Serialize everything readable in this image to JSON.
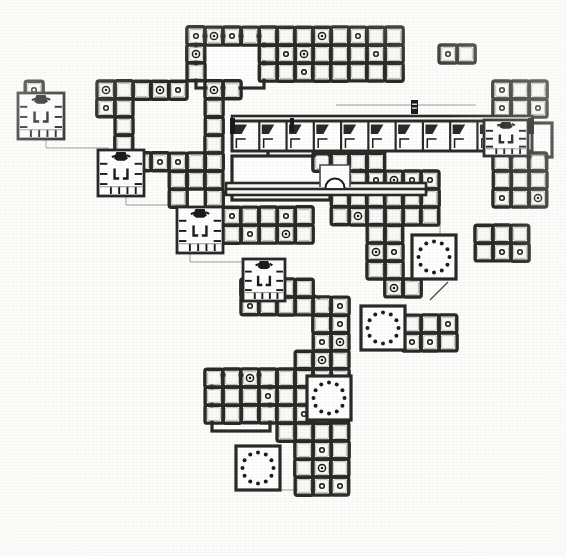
{
  "figure": {
    "title": "Archaeological ground plan of a multi-courtyard building complex",
    "type": "architectural-floor-plan",
    "medium": "scanned line drawing, black ink on off-white paper",
    "canvas": {
      "width": 566,
      "height": 556
    },
    "orientation": "plan view, north up (unmarked)",
    "caption": "",
    "scale_bar": "",
    "north_arrow": "",
    "labels": []
  },
  "colors": {
    "paper": "#fdfdfc",
    "ink": "#1a1a1a",
    "ink_mid": "#4a4a48",
    "ink_light": "#8d8d88",
    "wall_fill": "#2b2a28",
    "bay_interior": "#fbfaf8",
    "hatch": "#6f6e6a"
  },
  "geometry": {
    "module_px": 18.0,
    "origin_x": 16.0,
    "origin_y": 18.0,
    "wall_thickness_px": 3.4,
    "inner_inset_px": 2.6,
    "bay_corner_radius_px": 2.2,
    "column_dot_radius_px": 2.3,
    "column_ring_radius_px": 3.6
  },
  "legend_symbols": [
    {
      "name": "square-bay",
      "meaning": "roofed square bay / chamber unit",
      "count_note": "grid module"
    },
    {
      "name": "column-marker",
      "meaning": "small ring = standing column or pillar base inside bay"
    },
    {
      "name": "circular-colonnade",
      "meaning": "ring of dots = circular arrangement of columns in open court"
    },
    {
      "name": "shrine-module",
      "meaning": "detailed cell block with interior partitions and solid black feature"
    },
    {
      "name": "apse-niche",
      "meaning": "semicircular recess on corridor wall"
    },
    {
      "name": "pier-marker",
      "meaning": "small solid black pier symbol with light banding"
    },
    {
      "name": "thin-line",
      "meaning": "faint construction / projection line"
    }
  ],
  "plan": {
    "bay_blocks": [
      {
        "id": "b01",
        "col": 5,
        "row": 0,
        "cols": 9,
        "rows": 1,
        "note": "north range top row"
      },
      {
        "id": "b02",
        "col": 5,
        "row": 1,
        "cols": 9,
        "rows": 1,
        "note": "north range second row"
      },
      {
        "id": "b03",
        "col": 5,
        "row": 2,
        "cols": 4,
        "rows": 1,
        "note": "north range west arm"
      },
      {
        "id": "b04",
        "col": 9,
        "row": 2,
        "cols": 5,
        "rows": 1,
        "note": "north range east arm"
      },
      {
        "id": "b05",
        "col": 5,
        "row": 3,
        "cols": 1,
        "rows": 1,
        "note": "west pier of north court"
      },
      {
        "id": "b06",
        "col": 9,
        "row": 3,
        "cols": 2,
        "rows": 1,
        "note": "east side of north court"
      },
      {
        "id": "b07",
        "col": 1,
        "row": 4,
        "cols": 1,
        "rows": 3,
        "note": "far-west shrine outer wall"
      },
      {
        "id": "b08",
        "col": 4,
        "row": 4,
        "cols": 2,
        "rows": 2,
        "note": "west link block"
      },
      {
        "id": "b09",
        "col": 9,
        "row": 4,
        "cols": 2,
        "rows": 1,
        "note": "central spine"
      },
      {
        "id": "b10",
        "col": 9,
        "row": 5,
        "cols": 1,
        "rows": 1,
        "note": "central spine"
      },
      {
        "id": "b11",
        "col": 5,
        "row": 6,
        "cols": 2,
        "rows": 1,
        "note": "west corridor"
      },
      {
        "id": "b12",
        "col": 9,
        "row": 6,
        "cols": 1,
        "rows": 1,
        "note": "central spine"
      },
      {
        "id": "b13",
        "col": 5,
        "row": 7,
        "cols": 1,
        "rows": 3,
        "note": "west corridor run"
      },
      {
        "id": "b14",
        "col": 9,
        "row": 7,
        "cols": 1,
        "rows": 1,
        "note": "central spine"
      },
      {
        "id": "b15",
        "col": 6,
        "row": 8,
        "cols": 4,
        "rows": 1,
        "note": "mid cross corridor"
      },
      {
        "id": "b16",
        "col": 9,
        "row": 9,
        "cols": 1,
        "rows": 1,
        "note": "central spine"
      },
      {
        "id": "b17",
        "col": 10,
        "row": 9,
        "cols": 3,
        "rows": 1,
        "note": "east wing row"
      },
      {
        "id": "b18",
        "col": 6,
        "row": 10,
        "cols": 2,
        "rows": 2,
        "note": "third shrine surround"
      },
      {
        "id": "b19",
        "col": 9,
        "row": 10,
        "cols": 5,
        "rows": 1,
        "note": "east wing row"
      },
      {
        "id": "b20",
        "col": 9,
        "row": 11,
        "cols": 5,
        "rows": 1,
        "note": "east wing row"
      },
      {
        "id": "b21",
        "col": 9,
        "row": 12,
        "cols": 5,
        "rows": 1,
        "note": "east wing row"
      },
      {
        "id": "b22",
        "col": 12,
        "row": 13,
        "cols": 4,
        "rows": 1,
        "note": "south-east range"
      },
      {
        "id": "b23",
        "col": 12,
        "row": 14,
        "cols": 4,
        "rows": 1,
        "note": "south-east range"
      },
      {
        "id": "b24",
        "col": 11,
        "row": 15,
        "cols": 2,
        "rows": 1,
        "note": "court edge"
      },
      {
        "id": "b25",
        "col": 10,
        "row": 16,
        "cols": 2,
        "rows": 2,
        "note": "south spine"
      },
      {
        "id": "b26",
        "col": 11,
        "row": 18,
        "cols": 5,
        "rows": 1,
        "note": "south range"
      },
      {
        "id": "b27",
        "col": 11,
        "row": 19,
        "cols": 5,
        "rows": 1,
        "note": "south range"
      },
      {
        "id": "b28",
        "col": 12,
        "row": 20,
        "cols": 2,
        "rows": 1,
        "note": "south tail"
      },
      {
        "id": "b29",
        "col": 12,
        "row": 21,
        "cols": 2,
        "rows": 1,
        "note": "south tail"
      },
      {
        "id": "b30",
        "col": 12,
        "row": 22,
        "cols": 2,
        "rows": 1,
        "note": "south tail"
      },
      {
        "id": "b31",
        "col": 24,
        "row": 3,
        "cols": 4,
        "rows": 2,
        "note": "north-east outlier block"
      },
      {
        "id": "b32",
        "col": 26,
        "row": 5,
        "cols": 2,
        "rows": 2,
        "note": "east tower"
      },
      {
        "id": "b33",
        "col": 26,
        "row": 8,
        "cols": 2,
        "rows": 3,
        "note": "east tower lower"
      }
    ],
    "bay_grid_regions": [
      {
        "id": "r-north-block",
        "col": 6,
        "row": 0,
        "cols": 8,
        "rows": 3,
        "label": "north range (3 x 8 bays)"
      },
      {
        "id": "r-west-shrine-court",
        "col": 1,
        "row": 4,
        "cols": 4,
        "rows": 3,
        "label": "west shrine court"
      },
      {
        "id": "r-central-spine",
        "col": 9,
        "row": 3,
        "cols": 2,
        "rows": 6,
        "label": "central north-south spine"
      },
      {
        "id": "r-east-range",
        "col": 16,
        "row": 6,
        "cols": 6,
        "rows": 3,
        "label": "east range"
      },
      {
        "id": "r-circ-court-1",
        "col": 22,
        "row": 12,
        "cols": 4,
        "rows": 4,
        "label": "circular colonnade court 1"
      },
      {
        "id": "r-circ-court-2",
        "col": 18,
        "row": 17,
        "cols": 4,
        "rows": 4,
        "label": "circular colonnade court 2"
      },
      {
        "id": "r-circ-court-3",
        "col": 13,
        "row": 23,
        "cols": 4,
        "rows": 4,
        "label": "circular colonnade court 3"
      },
      {
        "id": "r-south-block",
        "col": 11,
        "row": 19,
        "cols": 8,
        "rows": 4,
        "label": "south block"
      }
    ],
    "circular_colonnades": [
      {
        "id": "cc1",
        "cx": 434,
        "cy": 257,
        "court_w": 44,
        "court_h": 44,
        "ring_r": 15.5,
        "dots": 12,
        "label": "circular colonnade court (north-east)"
      },
      {
        "id": "cc2",
        "cx": 383,
        "cy": 328,
        "court_w": 44,
        "court_h": 44,
        "ring_r": 15.5,
        "dots": 12,
        "label": "circular colonnade court (middle)"
      },
      {
        "id": "cc3",
        "cx": 329,
        "cy": 398,
        "court_w": 44,
        "court_h": 44,
        "ring_r": 15.5,
        "dots": 12,
        "label": "circular colonnade court (south-east)"
      },
      {
        "id": "cc4",
        "cx": 258,
        "cy": 468,
        "court_w": 44,
        "court_h": 44,
        "ring_r": 15.5,
        "dots": 12,
        "label": "circular colonnade court (south-west)"
      }
    ],
    "shrine_modules": [
      {
        "id": "sh1",
        "x": 18,
        "y": 93,
        "w": 46,
        "h": 46,
        "label": "shrine module 1 (north-west)"
      },
      {
        "id": "sh2",
        "x": 98,
        "y": 150,
        "w": 46,
        "h": 46,
        "label": "shrine module 2"
      },
      {
        "id": "sh3",
        "x": 177,
        "y": 207,
        "w": 46,
        "h": 46,
        "label": "shrine module 3"
      },
      {
        "id": "sh4",
        "x": 243,
        "y": 259,
        "w": 42,
        "h": 42,
        "label": "shrine module 4 (centre)"
      },
      {
        "id": "sh5",
        "x": 484,
        "y": 120,
        "w": 44,
        "h": 36,
        "label": "shrine module 5 (east, mirrored)"
      }
    ],
    "cell_row": {
      "id": "cellrow-1",
      "x": 232,
      "y": 121,
      "w": 300,
      "h": 30,
      "cells": 11,
      "label": "long range of uniform cells with angled partitions"
    },
    "corridors": [
      {
        "id": "cor-upper",
        "x": 232,
        "y": 116,
        "w": 300,
        "h": 7,
        "orient": "h",
        "label": "upper corridor wall"
      },
      {
        "id": "cor-mid",
        "x": 226,
        "y": 183,
        "w": 200,
        "h": 9,
        "orient": "h",
        "label": "mid corridor with apse"
      },
      {
        "id": "cor-lower",
        "x": 226,
        "y": 189,
        "w": 200,
        "h": 6,
        "orient": "h",
        "label": "mid corridor south wall"
      }
    ],
    "apse": {
      "id": "apse-1",
      "cx": 335,
      "cy": 185,
      "r": 9.5,
      "box_w": 30,
      "box_h": 20,
      "label": "semicircular apse / niche on corridor"
    },
    "open_courts": [
      {
        "id": "oc1",
        "x": 196,
        "y": 36,
        "w": 68,
        "h": 52,
        "label": "open court, north range"
      },
      {
        "id": "oc2",
        "x": 268,
        "y": 124,
        "w": 60,
        "h": 44,
        "label": "open court (east of cell row)"
      },
      {
        "id": "oc3",
        "x": 232,
        "y": 156,
        "w": 98,
        "h": 44,
        "label": "open hall south of corridor"
      },
      {
        "id": "oc4",
        "x": 212,
        "y": 375,
        "w": 58,
        "h": 56,
        "label": "open court, south block"
      },
      {
        "id": "oc5",
        "x": 508,
        "y": 123,
        "w": 44,
        "h": 34,
        "label": "open court, east outlier"
      }
    ],
    "thin_lines": [
      {
        "id": "tl1",
        "points": "46,139 46,148 108,148 108,152",
        "label": "projection line shrine 1 to shrine 2"
      },
      {
        "id": "tl2",
        "points": "126,196 126,205 186,205 186,209",
        "label": "projection line shrine 2 to shrine 3"
      },
      {
        "id": "tl3",
        "points": "190,253 190,262 252,262 252,266",
        "label": "projection line shrine 3 to shrine 4"
      },
      {
        "id": "tl4",
        "points": "262,301 262,312 320,312",
        "label": "projection line shrine 4 south"
      },
      {
        "id": "tl5",
        "points": "336,105 476,105",
        "label": "long faint alignment line above cell row"
      },
      {
        "id": "tl6",
        "points": "276,478 276,490 316,490",
        "label": "projection line from south-west court"
      },
      {
        "id": "tl7",
        "points": "452,148 546,148",
        "label": "faint alignment line east"
      },
      {
        "id": "tl8",
        "points": "440,196 440,240",
        "label": "faint vertical alignment east wing"
      },
      {
        "id": "tl9",
        "points": "498,100 498,90 546,90",
        "label": "faint line north-east outlier"
      }
    ],
    "pier_marker": {
      "id": "pier-1",
      "x": 411,
      "y": 100,
      "w": 7,
      "h": 14,
      "label": "solid pier / doorway jamb symbol"
    },
    "diagonal_links": [
      {
        "id": "dl1",
        "points": "352,160 370,178",
        "label": "diagonal splay wall north of spine"
      },
      {
        "id": "dl2",
        "points": "312,292 330,310",
        "label": "diagonal splay wall mid plan"
      },
      {
        "id": "dl3",
        "points": "430,300 448,282",
        "label": "diagonal splay wall east"
      }
    ]
  },
  "statistics": {
    "module_count_estimate": 330,
    "circular_courts": 4,
    "shrine_modules": 5,
    "uniform_cells_in_row": 11,
    "columned_bays_estimate": 54
  }
}
